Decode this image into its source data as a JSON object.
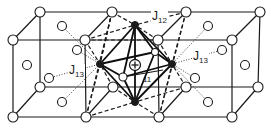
{
  "figure": {
    "type": "crystal lattice diagram",
    "colors": {
      "line": "#1a1a1a",
      "background": "#ffffff",
      "atom_fill": "#ffffff"
    }
  },
  "labels": {
    "j12": {
      "main": "J",
      "sub": "12"
    },
    "j13_left": {
      "main": "J",
      "sub": "13"
    },
    "j13_right": {
      "main": "J",
      "sub": "13"
    },
    "j11": {
      "main": "",
      "sub": "11"
    },
    "center_symbol": "+"
  }
}
